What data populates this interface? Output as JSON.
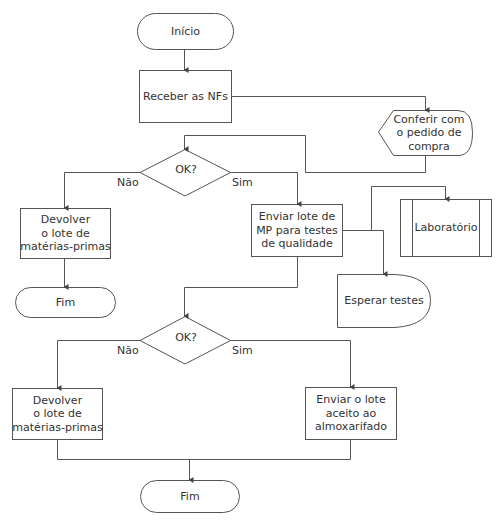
{
  "diagram": {
    "type": "flowchart",
    "colors": {
      "stroke": "#555555",
      "text": "#333333",
      "background": "#ffffff"
    },
    "nodes": [
      {
        "id": "inicio",
        "shape": "terminal",
        "label": "Início"
      },
      {
        "id": "receber",
        "shape": "process",
        "label": "Receber as NFs"
      },
      {
        "id": "conferir",
        "shape": "display",
        "label": "Conferir com\no pedido de\ncompra"
      },
      {
        "id": "ok1",
        "shape": "decision",
        "label": "OK?"
      },
      {
        "id": "devolver1",
        "shape": "process",
        "label": "Devolver\no lote de\nmatérias-primas"
      },
      {
        "id": "fim1",
        "shape": "terminal",
        "label": "Fim"
      },
      {
        "id": "enviar_mp",
        "shape": "process",
        "label": "Enviar lote de\nMP para testes\nde qualidade"
      },
      {
        "id": "laboratorio",
        "shape": "predefined-process",
        "label": "Laboratório"
      },
      {
        "id": "esperar",
        "shape": "delay",
        "label": "Esperar testes"
      },
      {
        "id": "ok2",
        "shape": "decision",
        "label": "OK?"
      },
      {
        "id": "devolver2",
        "shape": "process",
        "label": "Devolver\no lote de\nmatérias-primas"
      },
      {
        "id": "enviar_almox",
        "shape": "process",
        "label": "Enviar o lote\naceito ao\nalmoxarifado"
      },
      {
        "id": "fim2",
        "shape": "terminal",
        "label": "Fim"
      }
    ],
    "edges": [
      {
        "from": "inicio",
        "to": "receber",
        "label": ""
      },
      {
        "from": "receber",
        "to": "conferir",
        "label": ""
      },
      {
        "from": "conferir",
        "to": "ok1",
        "label": ""
      },
      {
        "from": "ok1",
        "to": "devolver1",
        "label": "Não"
      },
      {
        "from": "ok1",
        "to": "enviar_mp",
        "label": "Sim"
      },
      {
        "from": "devolver1",
        "to": "fim1",
        "label": ""
      },
      {
        "from": "enviar_mp",
        "to": "laboratorio",
        "label": ""
      },
      {
        "from": "enviar_mp",
        "to": "esperar",
        "label": ""
      },
      {
        "from": "enviar_mp",
        "to": "ok2",
        "label": ""
      },
      {
        "from": "ok2",
        "to": "devolver2",
        "label": "Não"
      },
      {
        "from": "ok2",
        "to": "enviar_almox",
        "label": "Sim"
      },
      {
        "from": "devolver2",
        "to": "fim2",
        "label": ""
      },
      {
        "from": "enviar_almox",
        "to": "fim2",
        "label": ""
      }
    ],
    "edge_labels": {
      "ok1_no": "Não",
      "ok1_yes": "Sim",
      "ok2_no": "Não",
      "ok2_yes": "Sim"
    }
  }
}
